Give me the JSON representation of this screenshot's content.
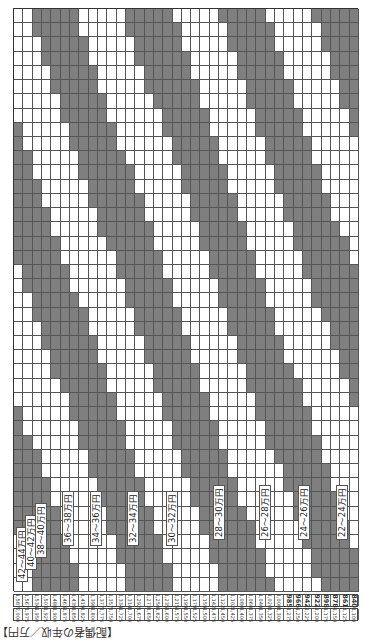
{
  "title_label": "【配偶者の年収／万円】",
  "colors": {
    "shade": "#7f7f7f",
    "light": "#ffffff",
    "line": "#555555"
  },
  "grid": {
    "columns": 37,
    "rows": 41
  },
  "row_top": [
    "2,000",
    "1,975",
    "1,950",
    "1,925",
    "1,900",
    "1,875",
    "1,850",
    "1,825",
    "1,800",
    "1,775",
    "1,750",
    "1,725",
    "1,700",
    "1,675",
    "1,650",
    "1,625",
    "1,600",
    "1,575",
    "1,550",
    "1,525",
    "1,500",
    "1,475",
    "1,450",
    "1,425",
    "1,400",
    "1,375",
    "1,350",
    "1,325",
    "1,300",
    "1,275",
    "1,250",
    "1,225",
    "1,200",
    "1,175",
    "1,150",
    "1,125",
    "1,100"
  ],
  "row_values": [
    "1,587",
    "1,567",
    "1,534",
    "1,503",
    "1,488",
    "1,463",
    "1,439",
    "1,419",
    "1,398",
    "1,377",
    "1,357",
    "1,334",
    "1,314",
    "1,292",
    "1,273",
    "1,250",
    "1,235",
    "1,215",
    "1,199",
    "1,179",
    "1,159",
    "1,142",
    "1,122",
    "1,102",
    "1,080",
    "1,060",
    "1,040",
    "1,020",
    "1,000",
    "985",
    "966",
    "942",
    "922",
    "898",
    "878",
    "861",
    "840"
  ],
  "bands": [
    {
      "label": "42～44万円"
    },
    {
      "label": "40～42万円"
    },
    {
      "label": "38～40万円"
    },
    {
      "label": "36～38万円"
    },
    {
      "label": "34～36万円"
    },
    {
      "label": "32～34万円"
    },
    {
      "label": "30～32万円"
    },
    {
      "label": "28～30万円"
    },
    {
      "label": "26～28万円"
    },
    {
      "label": "24～26万円"
    },
    {
      "label": "22～24万円"
    }
  ]
}
